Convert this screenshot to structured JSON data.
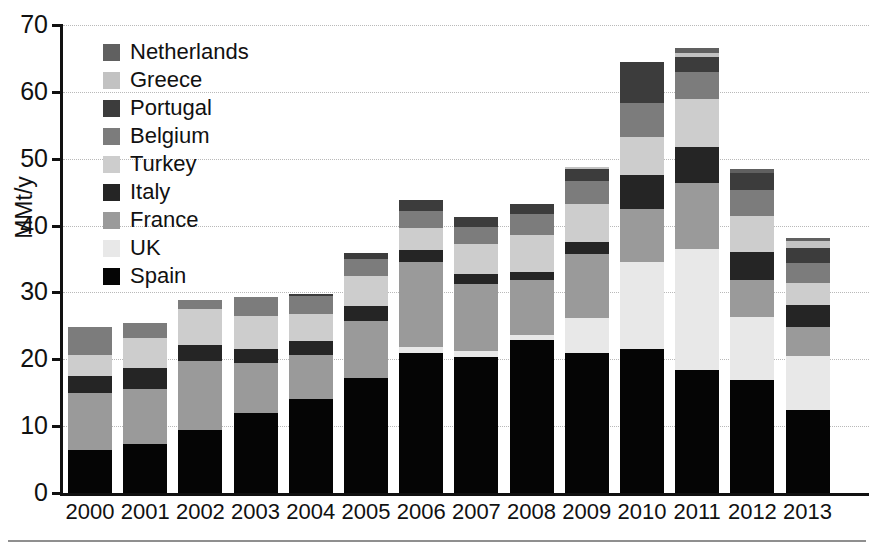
{
  "chart_data": {
    "type": "bar",
    "stacked": true,
    "title": "",
    "xlabel": "",
    "ylabel": "MMt/y",
    "ylim": [
      0,
      70
    ],
    "yticks": [
      0,
      10,
      20,
      30,
      40,
      50,
      60,
      70
    ],
    "grid": true,
    "legend_position": "upper-left inside",
    "categories": [
      "2000",
      "2001",
      "2002",
      "2003",
      "2004",
      "2005",
      "2006",
      "2007",
      "2008",
      "2009",
      "2010",
      "2011",
      "2012",
      "2013"
    ],
    "series": [
      {
        "name": "Spain",
        "color": "#050505",
        "values": [
          6.4,
          7.4,
          9.5,
          11.9,
          14.0,
          17.2,
          20.9,
          20.4,
          22.9,
          21.0,
          21.6,
          18.4,
          16.9,
          12.4
        ]
      },
      {
        "name": "UK",
        "color": "#e8e8e8",
        "values": [
          0.0,
          0.0,
          0.0,
          0.0,
          0.0,
          0.0,
          1.0,
          0.9,
          0.8,
          5.2,
          12.9,
          18.1,
          9.5,
          8.1
        ]
      },
      {
        "name": "France",
        "color": "#9a9a9a",
        "values": [
          8.6,
          8.2,
          10.2,
          7.6,
          6.7,
          8.6,
          12.6,
          10.0,
          8.2,
          9.5,
          8.0,
          9.8,
          5.5,
          4.4
        ]
      },
      {
        "name": "Italy",
        "color": "#252525",
        "values": [
          2.5,
          3.1,
          2.5,
          2.1,
          2.1,
          2.2,
          1.9,
          1.4,
          1.2,
          1.8,
          5.0,
          5.4,
          4.2,
          3.3
        ]
      },
      {
        "name": "Turkey",
        "color": "#cdcdcd",
        "values": [
          3.1,
          4.5,
          5.4,
          4.9,
          4.0,
          4.4,
          3.2,
          4.6,
          5.5,
          5.8,
          5.8,
          7.3,
          5.3,
          3.2
        ]
      },
      {
        "name": "Belgium",
        "color": "#7c7c7c",
        "values": [
          4.2,
          2.3,
          1.3,
          2.8,
          2.7,
          2.6,
          2.6,
          2.5,
          3.1,
          3.3,
          5.0,
          4.0,
          4.0,
          3.0
        ]
      },
      {
        "name": "Portugal",
        "color": "#3c3c3c",
        "values": [
          0.0,
          0.0,
          0.0,
          0.0,
          0.3,
          0.9,
          1.6,
          1.5,
          1.6,
          1.8,
          6.2,
          2.2,
          2.4,
          2.3
        ]
      },
      {
        "name": "Greece",
        "color": "#c2c2c2",
        "values": [
          0.0,
          0.0,
          0.0,
          0.0,
          0.0,
          0.0,
          0.0,
          0.0,
          0.0,
          0.3,
          0.0,
          0.6,
          0.0,
          1.0
        ]
      },
      {
        "name": "Netherlands",
        "color": "#606060",
        "values": [
          0.0,
          0.0,
          0.0,
          0.0,
          0.0,
          0.0,
          0.0,
          0.0,
          0.0,
          0.0,
          0.0,
          0.8,
          0.6,
          0.4
        ]
      }
    ],
    "totals": [
      24.8,
      25.5,
      28.9,
      29.3,
      29.8,
      35.9,
      43.8,
      41.3,
      43.3,
      48.7,
      64.5,
      66.6,
      48.4,
      38.1
    ]
  },
  "legend": {
    "entries": [
      {
        "label": "Netherlands",
        "color": "#606060"
      },
      {
        "label": "Greece",
        "color": "#c2c2c2"
      },
      {
        "label": "Portugal",
        "color": "#3c3c3c"
      },
      {
        "label": "Belgium",
        "color": "#7c7c7c"
      },
      {
        "label": "Turkey",
        "color": "#cdcdcd"
      },
      {
        "label": "Italy",
        "color": "#252525"
      },
      {
        "label": "France",
        "color": "#9a9a9a"
      },
      {
        "label": "UK",
        "color": "#e8e8e8"
      },
      {
        "label": "Spain",
        "color": "#050505"
      }
    ]
  },
  "axes": {
    "y_label": "MMt/y",
    "y_ticks": [
      "70",
      "60",
      "50",
      "40",
      "30",
      "20",
      "10",
      "0"
    ],
    "x_ticks": [
      "2000",
      "2001",
      "2002",
      "2003",
      "2004",
      "2005",
      "2006",
      "2007",
      "2008",
      "2009",
      "2010",
      "2011",
      "2012",
      "2013"
    ]
  },
  "colors": {
    "axis": "#111111",
    "grid": "#b9b9b9",
    "background": "#ffffff",
    "rule": "#8f8f8f"
  }
}
